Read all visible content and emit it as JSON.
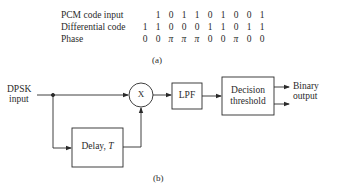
{
  "table": {
    "rows": [
      {
        "label": "PCM code input",
        "start_col": 1,
        "values": [
          "1",
          "0",
          "1",
          "1",
          "0",
          "1",
          "0",
          "0",
          "1"
        ]
      },
      {
        "label": "Differential code",
        "start_col": 0,
        "values": [
          "1",
          "1",
          "0",
          "0",
          "0",
          "1",
          "1",
          "0",
          "1",
          "1"
        ]
      },
      {
        "label": "Phase",
        "start_col": 0,
        "values": [
          "0",
          "0",
          "π",
          "π",
          "π",
          "0",
          "0",
          "π",
          "0",
          "0"
        ]
      }
    ],
    "caption": "(a)"
  },
  "diagram": {
    "input_label_line1": "DPSK",
    "input_label_line2": "input",
    "multiplier_label": "X",
    "lpf_label": "LPF",
    "decision_label_line1": "Decision",
    "decision_label_line2": "threshold",
    "delay_label": "Delay, ",
    "delay_var": "T",
    "output_label_line1": "Binary",
    "output_label_line2": "output",
    "caption": "(b)"
  }
}
